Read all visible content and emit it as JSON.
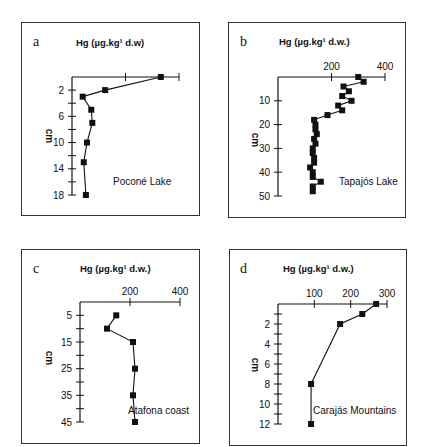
{
  "panels": [
    {
      "letter": "a",
      "title": "Hg (µg.kg¹ d.w)",
      "site": "Poconé Lake",
      "ylabel": "cm"
    },
    {
      "letter": "b",
      "title": "Hg (µg.kg¹ d.w.)",
      "site": "Tapajós Lake",
      "ylabel": "cm"
    },
    {
      "letter": "c",
      "title": "Hg (µg.kg¹ d.w.)",
      "site": "Atafona coast",
      "ylabel": "cm"
    },
    {
      "letter": "d",
      "title": "Hg (µg.kg¹ d.w.)",
      "site": "Carajás Mountains",
      "ylabel": "cm"
    }
  ],
  "chart_data": [
    {
      "type": "line",
      "panel": "a",
      "title": "Hg (µg.kg-1 d.w)",
      "xlabel": "Hg (µg.kg-1 d.w)",
      "ylabel": "cm",
      "annotation": "Poconé Lake",
      "x_tick_labels": [],
      "y_tick_labels": [
        "2",
        "6",
        "10",
        "14",
        "18"
      ],
      "y_inverted": true,
      "ylim": [
        0,
        18
      ],
      "grid": false,
      "depth_cm": [
        0,
        2,
        3,
        5,
        7,
        10,
        13,
        18
      ],
      "hg": [
        0.83,
        0.31,
        0.1,
        0.18,
        0.19,
        0.14,
        0.11,
        0.13
      ],
      "note": "x-axis has 3 unlabeled ticks; values expressed as fraction of axis length"
    },
    {
      "type": "line",
      "panel": "b",
      "title": "Hg (µg.kg-1 d.w.)",
      "xlabel": "Hg (µg.kg-1 d.w.)",
      "ylabel": "cm",
      "annotation": "Tapajós Lake",
      "x_tick_labels": [
        "200",
        "400"
      ],
      "xlim": [
        0,
        400
      ],
      "y_tick_labels": [
        "10",
        "20",
        "30",
        "40",
        "50"
      ],
      "ylim": [
        0,
        50
      ],
      "y_inverted": true,
      "grid": false,
      "depth_cm": [
        0,
        2,
        4,
        6,
        8,
        10,
        12,
        14,
        16,
        18,
        20,
        22,
        24,
        26,
        28,
        30,
        32,
        34,
        36,
        38,
        40,
        42,
        44,
        46,
        48
      ],
      "hg": [
        300,
        320,
        245,
        265,
        240,
        275,
        225,
        240,
        185,
        135,
        140,
        140,
        145,
        135,
        140,
        130,
        130,
        135,
        135,
        120,
        130,
        130,
        160,
        130,
        130
      ]
    },
    {
      "type": "line",
      "panel": "c",
      "title": "Hg (µg.kg-1 d.w.)",
      "xlabel": "Hg (µg.kg-1 d.w.)",
      "ylabel": "cm",
      "annotation": "Atafona coast",
      "x_tick_labels": [
        "200",
        "400"
      ],
      "xlim": [
        0,
        400
      ],
      "y_tick_labels": [
        "5",
        "15",
        "25",
        "35",
        "45"
      ],
      "ylim": [
        0,
        45
      ],
      "y_inverted": true,
      "grid": false,
      "depth_cm": [
        5,
        10,
        15,
        25,
        35,
        45
      ],
      "hg": [
        145,
        108,
        212,
        220,
        212,
        220
      ]
    },
    {
      "type": "line",
      "panel": "d",
      "title": "Hg (µg.kg-1 d.w.)",
      "xlabel": "Hg (µg.kg-1 d.w.)",
      "ylabel": "cm",
      "annotation": "Carajás Mountains",
      "x_tick_labels": [
        "100",
        "200",
        "300"
      ],
      "xlim": [
        0,
        300
      ],
      "y_tick_labels": [
        "2",
        "4",
        "6",
        "8",
        "10",
        "12"
      ],
      "ylim": [
        0,
        12
      ],
      "y_inverted": true,
      "grid": false,
      "depth_cm": [
        0,
        1,
        2,
        8,
        12
      ],
      "hg": [
        270,
        232,
        171,
        91,
        91
      ]
    }
  ]
}
